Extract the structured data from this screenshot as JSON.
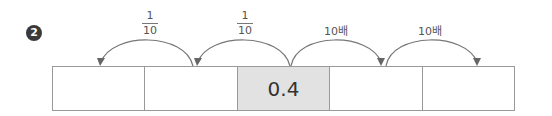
{
  "problem_number": "2",
  "arrows": [
    {
      "label_type": "fraction",
      "numerator": "1",
      "denominator": "10",
      "direction": "left"
    },
    {
      "label_type": "fraction",
      "numerator": "1",
      "denominator": "10",
      "direction": "left"
    },
    {
      "label_type": "text",
      "text": "10배",
      "direction": "right"
    },
    {
      "label_type": "text",
      "text": "10배",
      "direction": "right"
    }
  ],
  "cells": [
    "",
    "",
    "0.4",
    "",
    ""
  ],
  "highlight_cell_index": 2,
  "colors": {
    "highlight": "#e2e2e2",
    "arrow": "#666666",
    "border": "#999999"
  }
}
